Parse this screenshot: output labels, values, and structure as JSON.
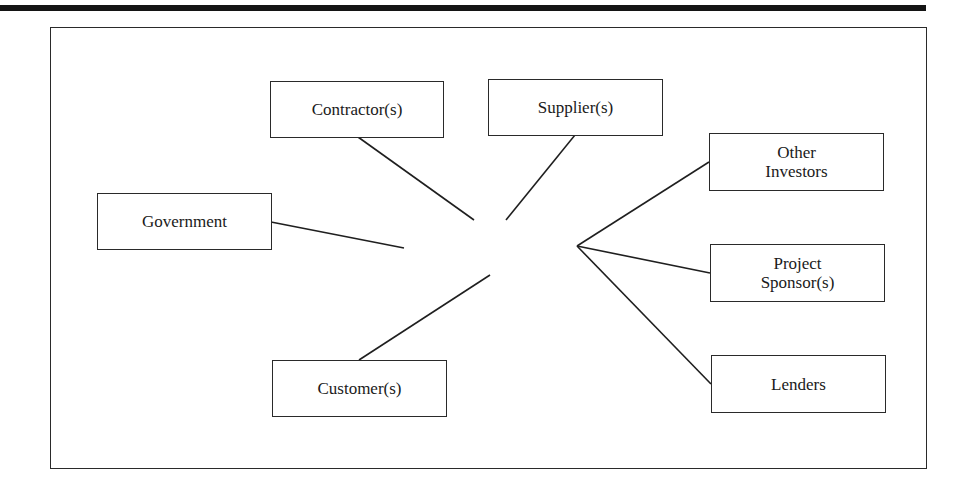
{
  "diagram": {
    "type": "stakeholder-network",
    "colors": {
      "line": "#1f1f1f",
      "border": "#2a2a2a",
      "background": "#ffffff",
      "text": "#1a1a1a"
    },
    "nodes": [
      {
        "id": "contractors",
        "label": "Contractor(s)"
      },
      {
        "id": "suppliers",
        "label": "Supplier(s)"
      },
      {
        "id": "government",
        "label": "Government"
      },
      {
        "id": "other-investors",
        "label": "Other\nInvestors",
        "lines": [
          "Other",
          "Investors"
        ]
      },
      {
        "id": "project-sponsors",
        "label": "Project\nSponsor(s)",
        "lines": [
          "Project",
          "Sponsor(s)"
        ]
      },
      {
        "id": "customers",
        "label": "Customer(s)"
      },
      {
        "id": "lenders",
        "label": "Lenders"
      }
    ],
    "edges": [
      {
        "from": "contractors",
        "to": "center"
      },
      {
        "from": "suppliers",
        "to": "center"
      },
      {
        "from": "government",
        "to": "center"
      },
      {
        "from": "customers",
        "to": "center"
      },
      {
        "from": "other-investors",
        "to": "hub-right"
      },
      {
        "from": "project-sponsors",
        "to": "hub-right"
      },
      {
        "from": "lenders",
        "to": "hub-right"
      }
    ]
  }
}
